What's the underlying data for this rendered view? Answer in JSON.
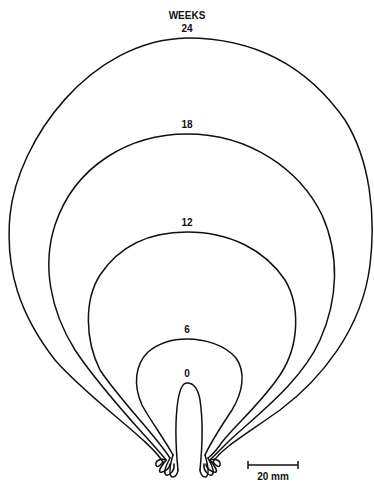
{
  "diagram": {
    "header": "WEEKS",
    "contours": [
      {
        "week": "24",
        "label_x": 187,
        "label_y": 24
      },
      {
        "week": "18",
        "label_x": 187,
        "label_y": 121
      },
      {
        "week": "12",
        "label_x": 187,
        "label_y": 219
      },
      {
        "week": "6",
        "label_x": 187,
        "label_y": 326
      },
      {
        "week": "0",
        "label_x": 187,
        "label_y": 370
      }
    ],
    "scale_bar": {
      "label": "20 mm",
      "length_px": 50
    },
    "line_color": "#111111",
    "background": "#ffffff"
  }
}
